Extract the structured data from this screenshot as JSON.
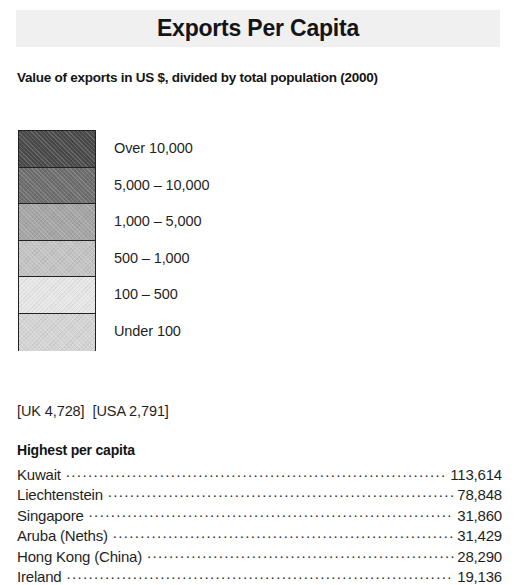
{
  "header": {
    "title": "Exports Per Capita",
    "subtitle": "Value of exports in US $, divided by total population (2000)",
    "band_color": "#f0f0f0"
  },
  "legend": {
    "items": [
      {
        "label": "Over 10,000",
        "color": "#4a4a4a"
      },
      {
        "label": "5,000 – 10,000",
        "color": "#6e6e6e"
      },
      {
        "label": "1,000 – 5,000",
        "color": "#a5a5a5"
      },
      {
        "label": "500 – 1,000",
        "color": "#c4c4c4"
      },
      {
        "label": "100 – 500",
        "color": "#e8e8e8"
      },
      {
        "label": "Under 100",
        "color": "#d5d5d5"
      }
    ]
  },
  "reference": {
    "uk": "[UK 4,728]",
    "usa": "[USA 2,791]"
  },
  "ranked": {
    "heading": "Highest per capita",
    "rows": [
      {
        "name": "Kuwait",
        "value": "113,614"
      },
      {
        "name": "Liechtenstein",
        "value": "78,848"
      },
      {
        "name": "Singapore",
        "value": "31,860"
      },
      {
        "name": "Aruba (Neths)",
        "value": "31,429"
      },
      {
        "name": "Hong Kong (China)",
        "value": "28,290"
      },
      {
        "name": "Ireland",
        "value": "19,136"
      }
    ]
  },
  "chart_data": {
    "type": "table",
    "title": "Exports Per Capita",
    "subtitle": "Value of exports in US $, divided by total population (2000)",
    "unit": "US $ per capita",
    "year": 2000,
    "legend_bins": [
      {
        "label": "Over 10,000",
        "min": 10000,
        "max": null,
        "color": "#4a4a4a"
      },
      {
        "label": "5,000 – 10,000",
        "min": 5000,
        "max": 10000,
        "color": "#6e6e6e"
      },
      {
        "label": "1,000 – 5,000",
        "min": 1000,
        "max": 5000,
        "color": "#a5a5a5"
      },
      {
        "label": "500 – 1,000",
        "min": 500,
        "max": 1000,
        "color": "#c4c4c4"
      },
      {
        "label": "100 – 500",
        "min": 100,
        "max": 500,
        "color": "#e8e8e8"
      },
      {
        "label": "Under 100",
        "min": null,
        "max": 100,
        "color": "#d5d5d5"
      }
    ],
    "reference_values": [
      {
        "name": "UK",
        "value": 4728
      },
      {
        "name": "USA",
        "value": 2791
      }
    ],
    "categories": [
      "Kuwait",
      "Liechtenstein",
      "Singapore",
      "Aruba (Neths)",
      "Hong Kong (China)",
      "Ireland"
    ],
    "values": [
      113614,
      78848,
      31860,
      31429,
      28290,
      19136
    ],
    "xlabel": "",
    "ylabel": "Exports per capita (US $)"
  }
}
